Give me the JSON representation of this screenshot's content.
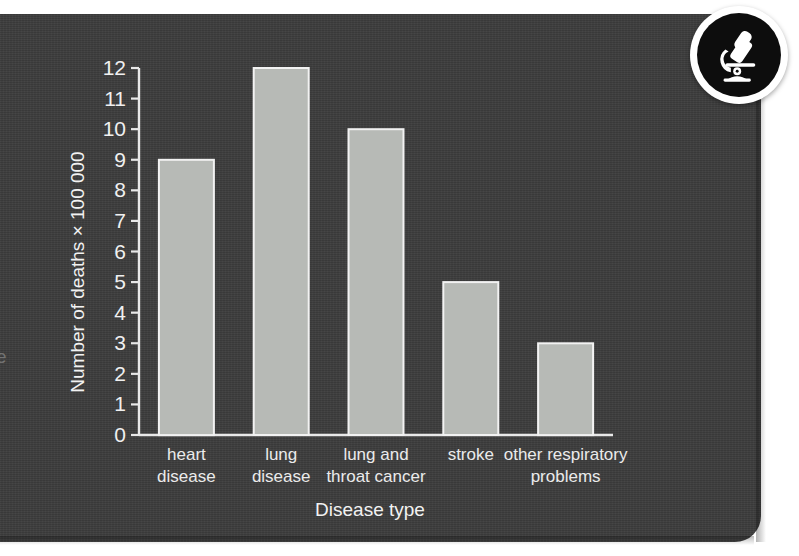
{
  "panel": {
    "background_color": "#3c3c3c",
    "edge_fragment": "e"
  },
  "badge": {
    "icon_name": "microscope-icon",
    "circle_color": "#0d0d0d",
    "ring_color": "#ffffff"
  },
  "chart_data": {
    "type": "bar",
    "title": "",
    "xlabel": "Disease type",
    "ylabel": "Number of deaths × 100 000",
    "categories": [
      "heart disease",
      "lung disease",
      "lung and throat cancer",
      "stroke",
      "other respiratory problems"
    ],
    "category_lines": [
      [
        "heart",
        "disease"
      ],
      [
        "lung",
        "disease"
      ],
      [
        "lung and",
        "throat cancer"
      ],
      [
        "stroke"
      ],
      [
        "other respiratory",
        "problems"
      ]
    ],
    "values": [
      9,
      12,
      10,
      5,
      3
    ],
    "ylim": [
      0,
      12
    ],
    "ytick_values": [
      0,
      1,
      2,
      3,
      4,
      5,
      6,
      7,
      8,
      9,
      10,
      11,
      12
    ],
    "ytick_labels": [
      "0",
      "1",
      "2",
      "3",
      "4",
      "5",
      "6",
      "7",
      "8",
      "9",
      "10",
      "11",
      "12"
    ],
    "grid": false,
    "legend": null,
    "bar_fill_color": "#b7bab6",
    "bar_stroke_color": "#f2f2f2",
    "axis_color": "#e8e8e8",
    "text_color": "#f0f0f0"
  }
}
